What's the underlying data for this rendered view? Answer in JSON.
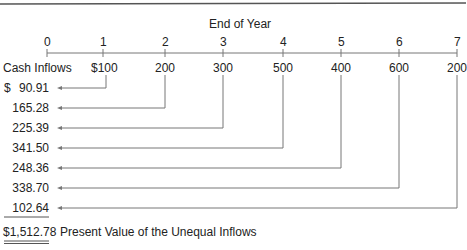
{
  "title": "End of Year",
  "years": [
    "0",
    "1",
    "2",
    "3",
    "4",
    "5",
    "6",
    "7"
  ],
  "row_label": "Cash Inflows",
  "inflows": [
    "$100",
    "200",
    "300",
    "500",
    "400",
    "600",
    "200"
  ],
  "present_values": [
    "90.91",
    "165.28",
    "225.39",
    "341.50",
    "248.36",
    "338.70",
    "102.64"
  ],
  "currency_symbol": "$",
  "total": "$1,512.78",
  "total_label": "Present Value of the Unequal Inflows",
  "colors": {
    "line": "#777777",
    "text": "#222222"
  }
}
